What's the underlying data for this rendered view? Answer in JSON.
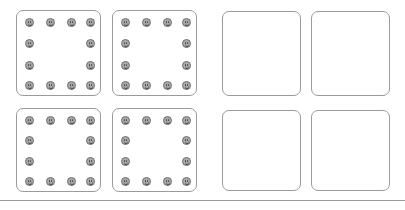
{
  "canvas": {
    "width": 405,
    "height": 210,
    "background_color": "#ffffff"
  },
  "style": {
    "panel_border_color": "#9b9b9b",
    "panel_fill_color": "#ffffff",
    "panel_corner_radius": 7,
    "face_fill_color": "#a9a9a9",
    "face_outline_color": "#6e6e6e",
    "face_feature_color": "#4a4a4a",
    "face_diameter": 9,
    "divider_color": "#9b9b9b"
  },
  "divider": {
    "label": "bottom-divider",
    "y": 200,
    "height": 1
  },
  "layout": {
    "rows": 2,
    "columns": 4,
    "description": "two rows of four rounded square panels"
  },
  "panels": [
    {
      "id": "panel-top-left-1",
      "label": "Top row, panel 1 (filled)",
      "x": 16,
      "y": 10,
      "width": 85,
      "height": 86,
      "filled": true,
      "face_count": 12,
      "faces": [
        {
          "x": 8,
          "y": 7
        },
        {
          "x": 29,
          "y": 7
        },
        {
          "x": 50,
          "y": 7
        },
        {
          "x": 69,
          "y": 7
        },
        {
          "x": 8,
          "y": 28
        },
        {
          "x": 69,
          "y": 28
        },
        {
          "x": 8,
          "y": 50
        },
        {
          "x": 69,
          "y": 50
        },
        {
          "x": 8,
          "y": 70
        },
        {
          "x": 29,
          "y": 70
        },
        {
          "x": 50,
          "y": 70
        },
        {
          "x": 69,
          "y": 70
        }
      ]
    },
    {
      "id": "panel-top-left-2",
      "label": "Top row, panel 2 (filled)",
      "x": 112,
      "y": 10,
      "width": 85,
      "height": 86,
      "filled": true,
      "face_count": 12,
      "faces": [
        {
          "x": 8,
          "y": 7
        },
        {
          "x": 29,
          "y": 7
        },
        {
          "x": 50,
          "y": 7
        },
        {
          "x": 69,
          "y": 7
        },
        {
          "x": 8,
          "y": 28
        },
        {
          "x": 69,
          "y": 28
        },
        {
          "x": 8,
          "y": 50
        },
        {
          "x": 69,
          "y": 50
        },
        {
          "x": 8,
          "y": 70
        },
        {
          "x": 29,
          "y": 70
        },
        {
          "x": 50,
          "y": 70
        },
        {
          "x": 69,
          "y": 70
        }
      ]
    },
    {
      "id": "panel-top-right-1",
      "label": "Top row, panel 3 (empty)",
      "x": 222,
      "y": 11,
      "width": 79,
      "height": 85,
      "filled": false,
      "face_count": 0,
      "faces": []
    },
    {
      "id": "panel-top-right-2",
      "label": "Top row, panel 4 (empty)",
      "x": 311,
      "y": 11,
      "width": 79,
      "height": 85,
      "filled": false,
      "face_count": 0,
      "faces": []
    },
    {
      "id": "panel-bottom-left-1",
      "label": "Bottom row, panel 1 (filled)",
      "x": 16,
      "y": 108,
      "width": 85,
      "height": 84,
      "filled": true,
      "face_count": 12,
      "faces": [
        {
          "x": 8,
          "y": 7
        },
        {
          "x": 29,
          "y": 7
        },
        {
          "x": 50,
          "y": 7
        },
        {
          "x": 69,
          "y": 7
        },
        {
          "x": 8,
          "y": 27
        },
        {
          "x": 69,
          "y": 27
        },
        {
          "x": 8,
          "y": 48
        },
        {
          "x": 69,
          "y": 48
        },
        {
          "x": 8,
          "y": 68
        },
        {
          "x": 29,
          "y": 68
        },
        {
          "x": 50,
          "y": 68
        },
        {
          "x": 69,
          "y": 68
        }
      ]
    },
    {
      "id": "panel-bottom-left-2",
      "label": "Bottom row, panel 2 (filled)",
      "x": 112,
      "y": 108,
      "width": 85,
      "height": 84,
      "filled": true,
      "face_count": 12,
      "faces": [
        {
          "x": 8,
          "y": 7
        },
        {
          "x": 29,
          "y": 7
        },
        {
          "x": 50,
          "y": 7
        },
        {
          "x": 69,
          "y": 7
        },
        {
          "x": 8,
          "y": 27
        },
        {
          "x": 69,
          "y": 27
        },
        {
          "x": 8,
          "y": 48
        },
        {
          "x": 69,
          "y": 48
        },
        {
          "x": 8,
          "y": 68
        },
        {
          "x": 29,
          "y": 68
        },
        {
          "x": 50,
          "y": 68
        },
        {
          "x": 69,
          "y": 68
        }
      ]
    },
    {
      "id": "panel-bottom-right-1",
      "label": "Bottom row, panel 3 (empty)",
      "x": 222,
      "y": 110,
      "width": 79,
      "height": 81,
      "filled": false,
      "face_count": 0,
      "faces": []
    },
    {
      "id": "panel-bottom-right-2",
      "label": "Bottom row, panel 4 (empty)",
      "x": 311,
      "y": 110,
      "width": 79,
      "height": 81,
      "filled": false,
      "face_count": 0,
      "faces": []
    }
  ]
}
